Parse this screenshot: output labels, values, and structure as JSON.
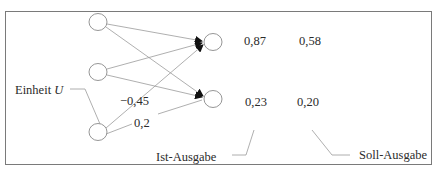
{
  "diagram": {
    "type": "neural-network",
    "colors": {
      "frame": "#7a7a7a",
      "lines": "#9a9a9a",
      "nodes": "#8a8a8a",
      "arrowhead": "#111111",
      "text": "#2b2b2b"
    },
    "input_nodes": [
      {
        "id": "in1",
        "cx": 98,
        "cy": 22
      },
      {
        "id": "in2",
        "cx": 98,
        "cy": 72
      },
      {
        "id": "in3",
        "cx": 98,
        "cy": 132
      }
    ],
    "output_nodes": [
      {
        "id": "out1",
        "cx": 211,
        "cy": 42
      },
      {
        "id": "out2",
        "cx": 211,
        "cy": 99
      }
    ],
    "labels": {
      "unit_label_prefix": "Einheit ",
      "unit_label_var": "U",
      "weight_1": "−0,45",
      "weight_2": "0,2",
      "ist_ausgabe": "Ist-Ausgabe",
      "soll_ausgabe": "Soll-Ausgabe"
    },
    "outputs": {
      "row1": {
        "ist": "0,87",
        "soll": "0,58"
      },
      "row2": {
        "ist": "0,23",
        "soll": "0,20"
      }
    }
  }
}
